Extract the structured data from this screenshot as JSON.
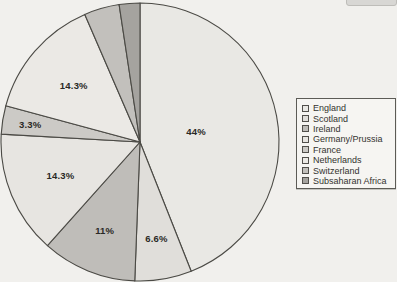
{
  "canvas": {
    "width": 397,
    "height": 282,
    "background": "#f1f0ed"
  },
  "chart_data": {
    "type": "pie",
    "title": "",
    "direction": "clockwise",
    "start_angle_deg": 0,
    "legend_position": "right",
    "center": {
      "x": 140,
      "y": 142
    },
    "radius": 139,
    "stroke_color": "#4b4a45",
    "slices": [
      {
        "name": "England",
        "value": 44,
        "label": "44%",
        "label_visible": true,
        "color": "#e9e8e4",
        "label_r": 0.41
      },
      {
        "name": "Scotland",
        "value": 6.6,
        "label": "6.6%",
        "label_visible": true,
        "color": "#e0deda",
        "label_r": 0.7
      },
      {
        "name": "Ireland",
        "value": 11,
        "label": "11%",
        "label_visible": true,
        "color": "#bfbdb9",
        "label_r": 0.68
      },
      {
        "name": "Germany/Prussia",
        "value": 14.3,
        "label": "14.3%",
        "label_visible": true,
        "color": "#e7e5e1",
        "label_r": 0.62
      },
      {
        "name": "France",
        "value": 3.3,
        "label": "3.3%",
        "label_visible": true,
        "color": "#cccac6",
        "label_r": 0.8
      },
      {
        "name": "Netherlands",
        "value": 14.3,
        "label": "14.3%",
        "label_visible": true,
        "color": "#ebe9e5",
        "label_r": 0.63
      },
      {
        "name": "Switzerland",
        "value": 4.1,
        "label": "",
        "label_visible": false,
        "color": "#c2c0bc",
        "label_r": 0.8
      },
      {
        "name": "Subsaharan Africa",
        "value": 2.4,
        "label": "",
        "label_visible": false,
        "color": "#a5a39f",
        "label_r": 0.8
      }
    ]
  },
  "legend": {
    "border_color": "#5c5b56",
    "background": "#f6f5f2",
    "items": [
      "England",
      "Scotland",
      "Ireland",
      "Germany/Prussia",
      "France",
      "Netherlands",
      "Switzerland",
      "Subsaharan Africa"
    ]
  },
  "decor": {
    "top_right_fragment_color": "#d8d7d4"
  }
}
